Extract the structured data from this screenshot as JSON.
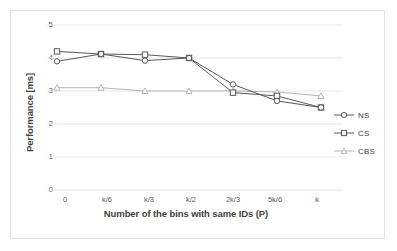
{
  "chart_data": {
    "type": "line",
    "title": "",
    "xlabel": "Number of the bins with same IDs (P)",
    "ylabel": "Performance [ms]",
    "categories": [
      "0",
      "k/6",
      "k/3",
      "k/2",
      "2k/3",
      "5k/6",
      "k"
    ],
    "yticks": [
      "0",
      "1",
      "2",
      "3",
      "4",
      "5"
    ],
    "ylim": [
      0,
      5
    ],
    "grid": "horizontal",
    "legend_position": "right",
    "series": [
      {
        "name": "NS",
        "marker": "circle",
        "color": "#595959",
        "values": [
          3.9,
          4.12,
          3.92,
          4.0,
          3.2,
          2.7,
          2.5
        ]
      },
      {
        "name": "CS",
        "marker": "square",
        "color": "#595959",
        "values": [
          4.2,
          4.12,
          4.1,
          4.0,
          2.95,
          2.85,
          2.5
        ]
      },
      {
        "name": "CBS",
        "marker": "triangle",
        "color": "#b5b5b5",
        "values": [
          3.1,
          3.1,
          3.0,
          3.0,
          3.0,
          2.97,
          2.85
        ]
      }
    ]
  },
  "legend": {
    "items": [
      {
        "label": "NS"
      },
      {
        "label": "CS"
      },
      {
        "label": "CBS"
      }
    ]
  },
  "colors": {
    "series_dark": "#595959",
    "series_light": "#b5b5b5",
    "gridline": "#e8e8e8",
    "frame": "#e3e3e3",
    "text": "#3f3f3f"
  }
}
